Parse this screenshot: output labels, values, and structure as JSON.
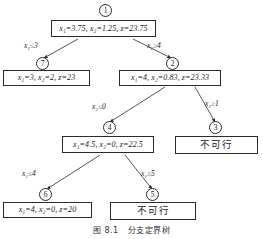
{
  "figure": {
    "caption_label": "图 8.1",
    "caption_title": "分支定界树"
  },
  "nodes": [
    {
      "id": "1",
      "circle_label": "1",
      "type": "solution",
      "text": "x₁=3.75, x₂=1.25, z=23.75",
      "values": {
        "x1": "3.75",
        "x2": "1.25",
        "z": "23.75"
      }
    },
    {
      "id": "7",
      "circle_label": "7",
      "type": "solution",
      "text": "x₁=3, x₂=2, z=23",
      "values": {
        "x1": "3",
        "x2": "2",
        "z": "23"
      }
    },
    {
      "id": "2",
      "circle_label": "2",
      "type": "solution",
      "text": "x₁=4, x₂=0.83, z=23.33",
      "values": {
        "x1": "4",
        "x2": "0.83",
        "z": "23.33"
      }
    },
    {
      "id": "4",
      "circle_label": "4",
      "type": "solution",
      "text": "x₁=4.5, x₂=0, z=22.5",
      "values": {
        "x1": "4.5",
        "x2": "0",
        "z": "22.5"
      }
    },
    {
      "id": "3",
      "circle_label": "3",
      "type": "infeasible",
      "text": "不可行"
    },
    {
      "id": "6",
      "circle_label": "6",
      "type": "solution",
      "text": "x₁=4, x₂=0, z=20",
      "values": {
        "x1": "4",
        "x2": "0",
        "z": "20"
      }
    },
    {
      "id": "5",
      "circle_label": "5",
      "type": "infeasible",
      "text": "不可行"
    }
  ],
  "edges": [
    {
      "from": "1",
      "to": "7",
      "label": "x₁≤3"
    },
    {
      "from": "1",
      "to": "2",
      "label": "x₁≥4"
    },
    {
      "from": "2",
      "to": "4",
      "label": "x₂≤0"
    },
    {
      "from": "2",
      "to": "3",
      "label": "x₂≥1"
    },
    {
      "from": "4",
      "to": "6",
      "label": "x₁≤4"
    },
    {
      "from": "4",
      "to": "5",
      "label": "x₁≥5"
    }
  ],
  "colors": {
    "stroke": "#2b2b2b",
    "background": "#ffffff",
    "text": "#1a1a1a"
  }
}
